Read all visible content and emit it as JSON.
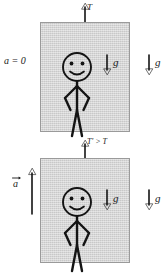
{
  "diagram": {
    "panels": [
      {
        "id": "panel-top",
        "name": "elevator-at-rest-or-constant-velocity",
        "acceleration_label": "a = 0",
        "tension_label": "T",
        "tension_arrow_direction": "up",
        "inside_gravity_label": "g",
        "inside_gravity_direction": "down",
        "outside_gravity_label": "g",
        "outside_gravity_direction": "down",
        "occupant": "smiling-stick-figure"
      },
      {
        "id": "panel-bottom",
        "name": "elevator-accelerating-upward",
        "acceleration_label": "a",
        "acceleration_vector_notation": "arrow-overbar",
        "acceleration_arrow_direction": "up",
        "tension_label": "T' > T",
        "tension_arrow_direction": "up",
        "inside_gravity_label": "g",
        "inside_gravity_direction": "down",
        "outside_gravity_label": "g",
        "outside_gravity_direction": "down",
        "occupant": "smiling-stick-figure"
      }
    ],
    "colors": {
      "box_fill": "#cfcfcf",
      "box_border": "#9a9a9a",
      "ink": "#141414",
      "background": "#ffffff"
    }
  }
}
